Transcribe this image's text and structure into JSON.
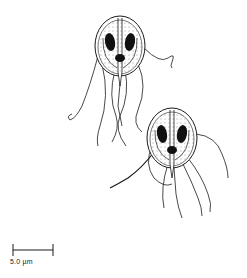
{
  "figure": {
    "organisms": [
      {
        "id": "organism-1",
        "center": [
          120,
          46
        ]
      },
      {
        "id": "organism-2",
        "center": [
          172,
          138
        ]
      }
    ],
    "scale_bar": {
      "label": "5.0 µm",
      "length_px": 40
    },
    "colors": {
      "ink": "#1a1a1a",
      "background": "#ffffff"
    }
  }
}
